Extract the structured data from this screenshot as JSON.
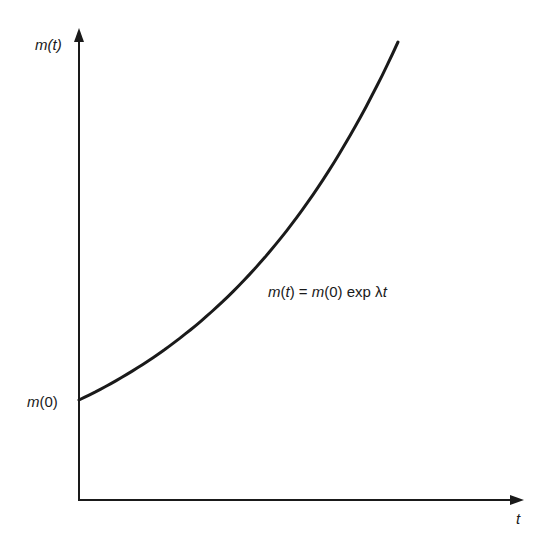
{
  "figure": {
    "y_axis_label": "m(t)",
    "x_axis_label": "t",
    "y_intercept_label": "m(0)",
    "equation": {
      "lhs": "m(t)",
      "equals": "=",
      "rhs_coeff": "m(0)",
      "rhs_func": "exp",
      "rhs_arg": "λt"
    },
    "colors": {
      "ink": "#1a1a1a",
      "background": "#ffffff"
    }
  },
  "chart_data": {
    "type": "line",
    "title": "",
    "xlabel": "t",
    "ylabel": "m(t)",
    "grid": false,
    "legend": "none",
    "annotations": [
      "m(t) = m(0) exp λt",
      "m(0)"
    ],
    "series": [
      {
        "name": "m(t) = m(0) exp λt",
        "x": [
          0,
          0.1,
          0.2,
          0.3,
          0.4,
          0.5,
          0.6,
          0.7,
          0.8,
          0.9,
          1.0
        ],
        "values": [
          1.0,
          1.16,
          1.36,
          1.58,
          1.84,
          2.14,
          2.49,
          2.9,
          3.38,
          3.93,
          4.58
        ]
      }
    ],
    "xlim": [
      0,
      1.38
    ],
    "ylim": [
      0,
      4.6
    ]
  }
}
